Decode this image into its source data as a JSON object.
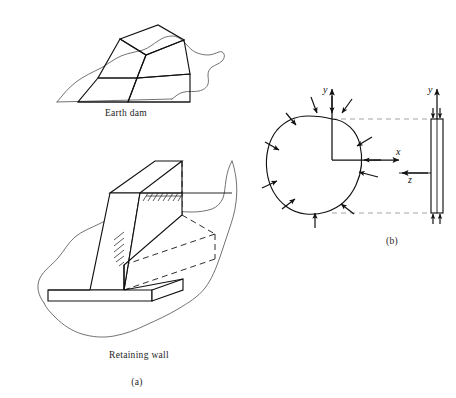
{
  "figure": {
    "background_color": "#ffffff",
    "ink_color": "#111111",
    "terrain_color": "#5a5a5a",
    "hidden_line_color": "#222222",
    "projection_line_color": "#9a9a9a"
  },
  "panel_a": {
    "caption": "(a)",
    "items": [
      {
        "id": "earth-dam",
        "caption": "Earth dam",
        "description": "Trapezoidal earth embankment shown in pictorial view set into irregular ground"
      },
      {
        "id": "retaining-wall",
        "caption": "Retaining wall",
        "description": "Cantilever T-shaped concrete retaining wall shown in pictorial view with hidden edges dashed and ground hatching"
      }
    ]
  },
  "panel_b": {
    "caption": "(b)",
    "description": "Cross section of a long prismatic body loaded by pressure normal to its boundary, with the edge view of the slab at right",
    "axes": [
      {
        "name": "y-axis-left",
        "label": "y",
        "direction": "up"
      },
      {
        "name": "x-axis",
        "label": "x",
        "direction": "right"
      },
      {
        "name": "z-axis",
        "label": "z",
        "direction": "left"
      },
      {
        "name": "y-axis-right",
        "label": "y",
        "direction": "up"
      }
    ],
    "load_arrows": {
      "count": 12,
      "sense": "inward, normal to boundary",
      "label": ""
    },
    "slab": {
      "name": "edge-view-slab",
      "end_arrow_count": 4
    }
  }
}
